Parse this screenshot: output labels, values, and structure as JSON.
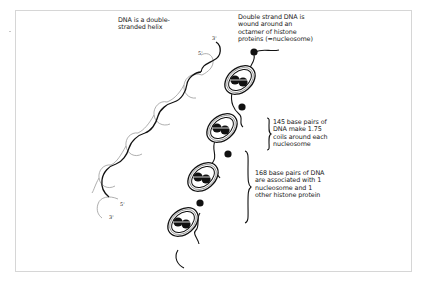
{
  "figure": {
    "colors": {
      "background": "#ffffff",
      "frame": "#d6d6d6",
      "strand_dark": "#111111",
      "strand_light": "#9a9a9a",
      "text": "#1a1a1a"
    }
  },
  "left_panel": {
    "caption_lines": [
      "DNA is a double-",
      "stranded helix"
    ],
    "end_labels": {
      "top_dark": "3'",
      "top_light": "5'",
      "bottom_dark": "5'",
      "bottom_light": "3'"
    }
  },
  "right_panel": {
    "caption_lines": [
      "Double strand DNA is",
      "wound around an",
      "octamer of histone",
      "proteins (=nucleosome)"
    ],
    "annotation_145_lines": [
      "145 base pairs of",
      "DNA make 1.75",
      "coils around each",
      "nucleosome"
    ],
    "annotation_168_lines": [
      "168 base pairs of DNA",
      "are associated with 1",
      "nucleosome and 1",
      "other histone protein"
    ],
    "nucleosome_count": 4,
    "linker_histone_count": 4
  }
}
